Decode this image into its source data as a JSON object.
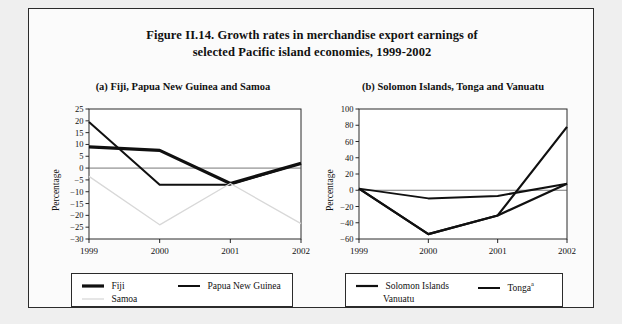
{
  "figure": {
    "title_line1": "Figure II.14.  Growth rates in merchandise export earnings of",
    "title_line2": "selected Pacific island economies, 1999-2002",
    "border_color": "#2b2b2b",
    "background": "#efefef",
    "panel_background": "#fbfbfb"
  },
  "panel_a": {
    "title": "(a)  Fiji, Papua New Guinea and Samoa",
    "legend": [
      {
        "label": "Fiji",
        "color": "#101010",
        "width": 3.2
      },
      {
        "label": "Papua New Guinea",
        "color": "#101010",
        "width": 2.0
      },
      {
        "label": "Samoa",
        "color": "#d8d8d8",
        "width": 1.3
      }
    ]
  },
  "panel_b": {
    "title": "(b)  Solomon Islands, Tonga and Vanuatu",
    "legend": [
      {
        "label": "Solomon Islands",
        "color": "#101010",
        "width": 2.2,
        "footnote": ""
      },
      {
        "label": "Tonga",
        "color": "#101010",
        "width": 2.0,
        "footnote": "a"
      },
      {
        "label": "Vanuatu",
        "color": "#101010",
        "width": 2.2,
        "footnote": ""
      }
    ]
  },
  "chart_data": [
    {
      "id": "panel-a",
      "type": "line",
      "title": "(a)  Fiji, Papua New Guinea and Samoa",
      "xlabel": "",
      "ylabel": "Percentage",
      "x": [
        "1999",
        "2000",
        "2001",
        "2002"
      ],
      "xticklabels": [
        "1999",
        "2000",
        "2001",
        "2002"
      ],
      "ylim": [
        -30,
        25
      ],
      "yticks": [
        25,
        20,
        15,
        10,
        5,
        0,
        -5,
        -10,
        -15,
        -20,
        -25,
        -30
      ],
      "yticklabels": [
        "25",
        "20",
        "15",
        "10",
        "5",
        "0",
        "−5",
        "−10",
        "−15",
        "−20",
        "−25",
        "−30"
      ],
      "grid": false,
      "zero_line": true,
      "legend_position": "below",
      "series": [
        {
          "name": "Fiji",
          "values": [
            9,
            7.5,
            -6.5,
            2
          ],
          "color": "#101010",
          "width": 3.2
        },
        {
          "name": "Papua New Guinea",
          "values": [
            19.5,
            -7,
            -7,
            2
          ],
          "color": "#101010",
          "width": 2.0
        },
        {
          "name": "Samoa",
          "values": [
            -3.5,
            -24,
            -6.5,
            -23.5
          ],
          "color": "#d8d8d8",
          "width": 1.3
        }
      ]
    },
    {
      "id": "panel-b",
      "type": "line",
      "title": "(b)  Solomon Islands, Tonga and Vanuatu",
      "xlabel": "",
      "ylabel": "Percentage",
      "x": [
        "1999",
        "2000",
        "2001",
        "2002"
      ],
      "xticklabels": [
        "1999",
        "2000",
        "2001",
        "2002"
      ],
      "ylim": [
        -60,
        100
      ],
      "yticks": [
        100,
        80,
        60,
        40,
        20,
        0,
        -20,
        -40,
        -60
      ],
      "yticklabels": [
        "100",
        "80",
        "60",
        "40",
        "20",
        "0",
        "−20",
        "−40",
        "−60"
      ],
      "grid": false,
      "zero_line": true,
      "legend_position": "below",
      "series": [
        {
          "name": "Solomon Islands",
          "values": [
            2,
            -54,
            -31,
            78
          ],
          "color": "#101010",
          "width": 2.2
        },
        {
          "name": "Tonga",
          "values": [
            2,
            -10,
            -7,
            8
          ],
          "color": "#101010",
          "width": 2.0
        },
        {
          "name": "Vanuatu",
          "values": [
            2,
            -54,
            -31,
            8
          ],
          "color": "#101010",
          "width": 2.2
        }
      ]
    }
  ]
}
